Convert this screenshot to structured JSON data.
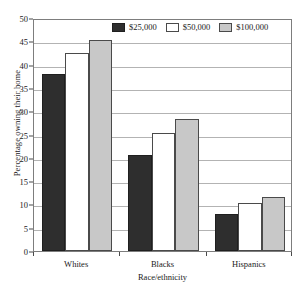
{
  "chart_data": {
    "type": "bar",
    "title": "",
    "xlabel": "Race/ethnicity",
    "ylabel": "Percentage owning their home",
    "categories": [
      "Whites",
      "Blacks",
      "Hispanics"
    ],
    "series": [
      {
        "name": "$25,000",
        "color": "#2e2e2e",
        "values": [
          38.0,
          20.7,
          7.9
        ]
      },
      {
        "name": "$50,000",
        "color": "#ffffff",
        "values": [
          42.5,
          25.3,
          10.2
        ]
      },
      {
        "name": "$100,000",
        "color": "#c8c8c8",
        "values": [
          45.2,
          28.4,
          11.5
        ]
      }
    ],
    "ylim": [
      0,
      50
    ],
    "yticks": [
      0,
      5,
      10,
      15,
      20,
      25,
      30,
      35,
      40,
      45,
      50
    ],
    "ytick_labels": [
      "0",
      "5",
      "10",
      "15",
      "20",
      "25",
      "30",
      "35",
      "40",
      "45",
      "50"
    ],
    "grid": true,
    "grid_axis": "y",
    "legend_position": "top-center",
    "legend_entries": [
      "$25,000",
      "$50,000",
      "$100,000"
    ]
  }
}
